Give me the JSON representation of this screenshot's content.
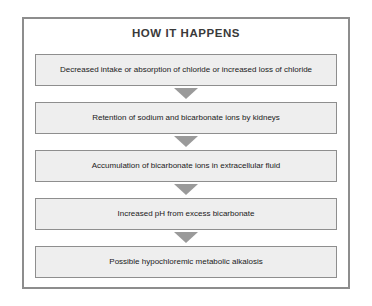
{
  "figure": {
    "title": "HOW IT HAPPENS",
    "colors": {
      "frame_border": "#8d8d8d",
      "box_fill": "#eeeeee",
      "box_border": "#8e8e8e",
      "arrow": "#9a9a9a",
      "title_text": "#3a3a3a",
      "body_text": "#1a1a1a",
      "background": "#ffffff"
    },
    "steps": [
      {
        "label": "Decreased intake or absorption of chloride or increased loss of chloride"
      },
      {
        "label": "Retention of sodium and bicarbonate ions by kidneys"
      },
      {
        "label": "Accumulation of bicarbonate ions in extracellular fluid"
      },
      {
        "label": "Increased pH from excess bicarbonate"
      },
      {
        "label": "Possible hypochloremic metabolic alkalosis"
      }
    ],
    "connector_icon": "arrow-down-triangle-icon"
  }
}
